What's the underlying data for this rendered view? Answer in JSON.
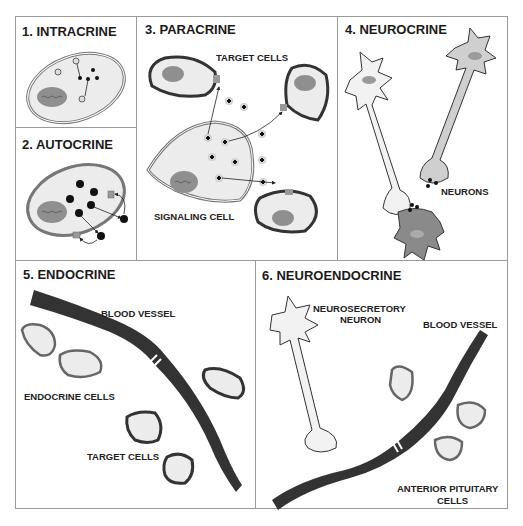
{
  "panels": {
    "intracrine": {
      "title": "1. INTRACRINE"
    },
    "autocrine": {
      "title": "2. AUTOCRINE"
    },
    "paracrine": {
      "title": "3. PARACRINE",
      "labels": {
        "target": "TARGET CELLS",
        "signaling": "SIGNALING CELL"
      }
    },
    "neurocrine": {
      "title": "4. NEUROCRINE",
      "labels": {
        "neurons": "NEURONS"
      }
    },
    "endocrine": {
      "title": "5. ENDOCRINE",
      "labels": {
        "vessel": "BLOOD VESSEL",
        "endocrine_cells": "ENDOCRINE CELLS",
        "target": "TARGET CELLS"
      }
    },
    "neuroendocrine": {
      "title": "6. NEUROENDOCRINE",
      "labels": {
        "neuron_l1": "NEUROSECRETORY",
        "neuron_l2": "NEURON",
        "vessel": "BLOOD VESSEL",
        "pit_l1": "ANTERIOR PITUITARY",
        "pit_l2": "CELLS"
      }
    }
  },
  "colors": {
    "border": "#9a9a9a",
    "cell_fill": "#ececec",
    "cell_stroke": "#6a6a6a",
    "dark": "#2f2f2f",
    "nucleus": "#8f8f8f",
    "vessel": "#333333"
  }
}
